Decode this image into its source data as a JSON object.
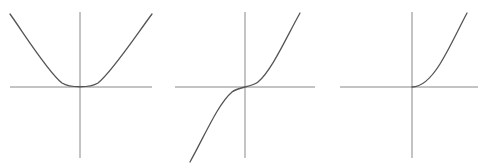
{
  "figure": {
    "title": "",
    "background_color": "#ffffff",
    "width": 486,
    "height": 166,
    "axis_color": "#888888",
    "curve_color": "#555555",
    "axis_stroke_width": 1,
    "curve_stroke_width": 1.3,
    "panel_count": 3
  },
  "chart_data": [
    {
      "type": "line",
      "title": "Even function (parabola)",
      "function_label": "y = x^2",
      "symmetry": "even",
      "xlabel": "x",
      "ylabel": "y",
      "xlim": [
        -3.5,
        3.5
      ],
      "ylim": [
        -2.0,
        3.6
      ],
      "grid": false,
      "legend": "none",
      "axes_shown": [
        "x-axis",
        "y-axis"
      ],
      "x": [
        -2.65,
        -2.4,
        -2.1,
        -1.8,
        -1.5,
        -1.2,
        -0.9,
        -0.6,
        -0.3,
        0,
        0.3,
        0.6,
        0.9,
        1.2,
        1.5,
        1.8,
        2.1,
        2.4,
        2.65
      ],
      "values": [
        3.51,
        2.88,
        2.21,
        1.62,
        1.13,
        0.72,
        0.41,
        0.18,
        0.045,
        0,
        0.045,
        0.18,
        0.41,
        0.72,
        1.13,
        1.62,
        2.21,
        2.88,
        3.51
      ],
      "pixel_geometry": {
        "x_axis_y": 87,
        "x_axis_x_start": 10,
        "x_axis_x_end": 152,
        "y_axis_x": 80,
        "y_axis_y_start": 12,
        "y_axis_y_end": 158,
        "curve_start": [
          10,
          14
        ],
        "curve_vertex": [
          80,
          87
        ],
        "curve_end": [
          152,
          14
        ]
      }
    },
    {
      "type": "line",
      "title": "Odd function (cubic)",
      "function_label": "y = x^3",
      "symmetry": "odd",
      "xlabel": "x",
      "ylabel": "y",
      "xlim": [
        -3.5,
        3.5
      ],
      "ylim": [
        -2.0,
        3.6
      ],
      "grid": false,
      "legend": "none",
      "axes_shown": [
        "x-axis",
        "y-axis"
      ],
      "x": [
        -1.65,
        -1.5,
        -1.3,
        -1.1,
        -0.9,
        -0.7,
        -0.5,
        -0.3,
        0,
        0.3,
        0.5,
        0.7,
        0.9,
        1.1,
        1.3,
        1.5,
        1.62
      ],
      "values": [
        -4.49,
        -3.38,
        -2.2,
        -1.33,
        -0.73,
        -0.34,
        -0.13,
        -0.03,
        0,
        0.03,
        0.13,
        0.34,
        0.73,
        1.33,
        2.2,
        3.38,
        4.25
      ],
      "pixel_geometry": {
        "x_axis_y": 87,
        "x_axis_x_start": 175,
        "x_axis_x_end": 315,
        "y_axis_x": 245,
        "y_axis_y_start": 12,
        "y_axis_y_end": 158,
        "curve_start": [
          190,
          162
        ],
        "curve_inflection": [
          245,
          87
        ],
        "curve_end": [
          300,
          13
        ]
      }
    },
    {
      "type": "line",
      "title": "Neither even nor odd (half parabola)",
      "function_label": "y = x^2 for x > 0, y = 0 for x <= 0",
      "symmetry": "none",
      "xlabel": "x",
      "ylabel": "y",
      "xlim": [
        -3.5,
        3.5
      ],
      "ylim": [
        -2.0,
        3.6
      ],
      "grid": false,
      "legend": "none",
      "axes_shown": [
        "x-axis",
        "y-axis"
      ],
      "x": [
        -3.3,
        -2.5,
        -1.8,
        -1.2,
        -0.6,
        0,
        0.4,
        0.8,
        1.2,
        1.6,
        2.0,
        2.4,
        2.75
      ],
      "values": [
        0,
        0,
        0,
        0,
        0,
        0,
        0.08,
        0.32,
        0.72,
        1.28,
        2.0,
        2.88,
        3.78
      ],
      "pixel_geometry": {
        "x_axis_y": 87,
        "x_axis_x_start": 340,
        "x_axis_x_end": 478,
        "y_axis_x": 412,
        "y_axis_y_start": 12,
        "y_axis_y_end": 158,
        "curve_start": [
          412,
          87
        ],
        "curve_end": [
          467,
          13
        ]
      }
    }
  ],
  "panels": [
    {
      "name": "parabola-panel",
      "x_axis_path": "M 10 87 L 152 87",
      "y_axis_path": "M 80 12 L 80 158",
      "curve_path": "M 10 14 C 25 35, 48 72, 62 83 C 70 88, 90 88, 98 83 C 112 72, 137 34, 152 14"
    },
    {
      "name": "cubic-panel",
      "x_axis_path": "M 175 87 L 315 87",
      "y_axis_path": "M 245 12 L 245 158",
      "curve_path": "M 190 162 C 205 135, 218 104, 232 92 C 238 87, 252 87, 258 82 C 272 70, 286 38, 300 13"
    },
    {
      "name": "half-parabola-panel",
      "x_axis_path": "M 340 87 L 478 87",
      "y_axis_path": "M 412 12 L 412 158",
      "curve_path": "M 412 87 C 421 87, 430 80, 440 64 C 450 48, 459 28, 467 13"
    }
  ]
}
